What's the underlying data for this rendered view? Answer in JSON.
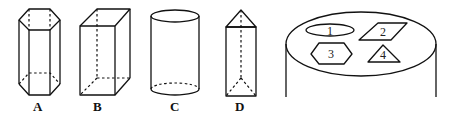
{
  "figure": {
    "solids": [
      {
        "id": "A",
        "label": "A",
        "shape": "hexagonal-prism"
      },
      {
        "id": "B",
        "label": "B",
        "shape": "rectangular-prism"
      },
      {
        "id": "C",
        "label": "C",
        "shape": "cylinder"
      },
      {
        "id": "D",
        "label": "D",
        "shape": "triangular-prism"
      }
    ],
    "cylinder_top": {
      "shapes": [
        {
          "label": "1",
          "shape": "ellipse"
        },
        {
          "label": "2",
          "shape": "parallelogram"
        },
        {
          "label": "3",
          "shape": "hexagon"
        },
        {
          "label": "4",
          "shape": "triangle"
        }
      ]
    }
  }
}
